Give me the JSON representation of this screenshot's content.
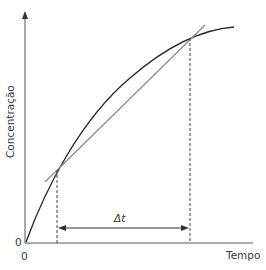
{
  "diagram": {
    "title": "",
    "y_axis": {
      "label": "Concentração",
      "origin_label": "0"
    },
    "x_axis": {
      "label": "Tempo",
      "origin_label": "0"
    },
    "interval_label": "Δt",
    "elements": [
      {
        "type": "curve",
        "description": "concentração vs tempo, concave down, passes through origin"
      },
      {
        "type": "secant-line",
        "description": "straight line through two points on the curve"
      },
      {
        "type": "dashed-vertical",
        "description": "drop line from first intersection point"
      },
      {
        "type": "dashed-vertical",
        "description": "drop line from second intersection point"
      },
      {
        "type": "double-arrow",
        "description": "Δt interval between the two drop lines"
      }
    ],
    "colors": {
      "curve": "#2b2b2b",
      "secant": "#8a8a8a",
      "axes": "#555555"
    }
  }
}
